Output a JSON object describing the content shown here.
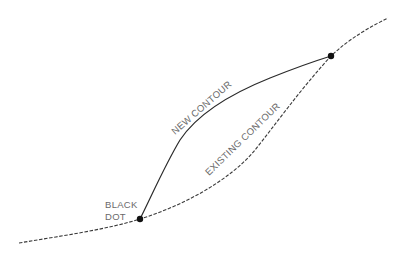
{
  "diagram": {
    "type": "grading contour diagram",
    "labels": {
      "new_contour": "NEW  CONTOUR",
      "existing_contour": "EXISTING  CONTOUR",
      "black_dot_line1": "BLACK",
      "black_dot_line2": "DOT"
    },
    "elements": [
      {
        "name": "existing-contour",
        "style": "dashed",
        "description": "Existing contour line spanning full width"
      },
      {
        "name": "new-contour",
        "style": "solid",
        "description": "New contour bowing upward between the two black dots"
      },
      {
        "name": "black-dot-lower",
        "position": [
          140,
          219
        ]
      },
      {
        "name": "black-dot-upper",
        "position": [
          331,
          56
        ]
      }
    ],
    "colors": {
      "line": "#2a2a2a",
      "label": "#6a6a6a",
      "dot": "#111111",
      "background": "#ffffff"
    }
  }
}
